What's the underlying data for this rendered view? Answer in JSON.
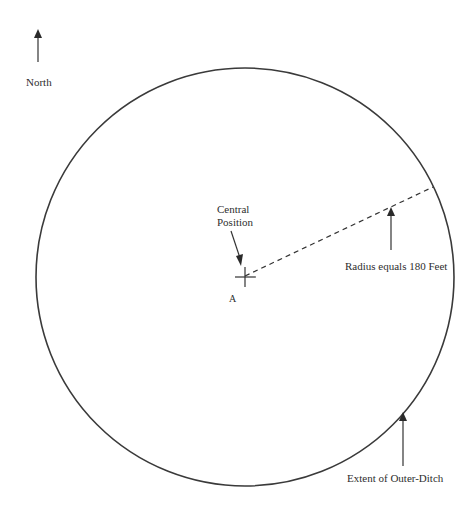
{
  "diagram": {
    "north_label": "North",
    "central_position_label_line1": "Central",
    "central_position_label_line2": "Position",
    "point_label": "A",
    "radius_label": "Radius equals 180 Feet",
    "outer_ditch_label": "Extent of Outer-Ditch",
    "radius_feet": 180,
    "colors": {
      "stroke": "#333333",
      "text": "#2e2e2e",
      "background": "#ffffff"
    }
  }
}
